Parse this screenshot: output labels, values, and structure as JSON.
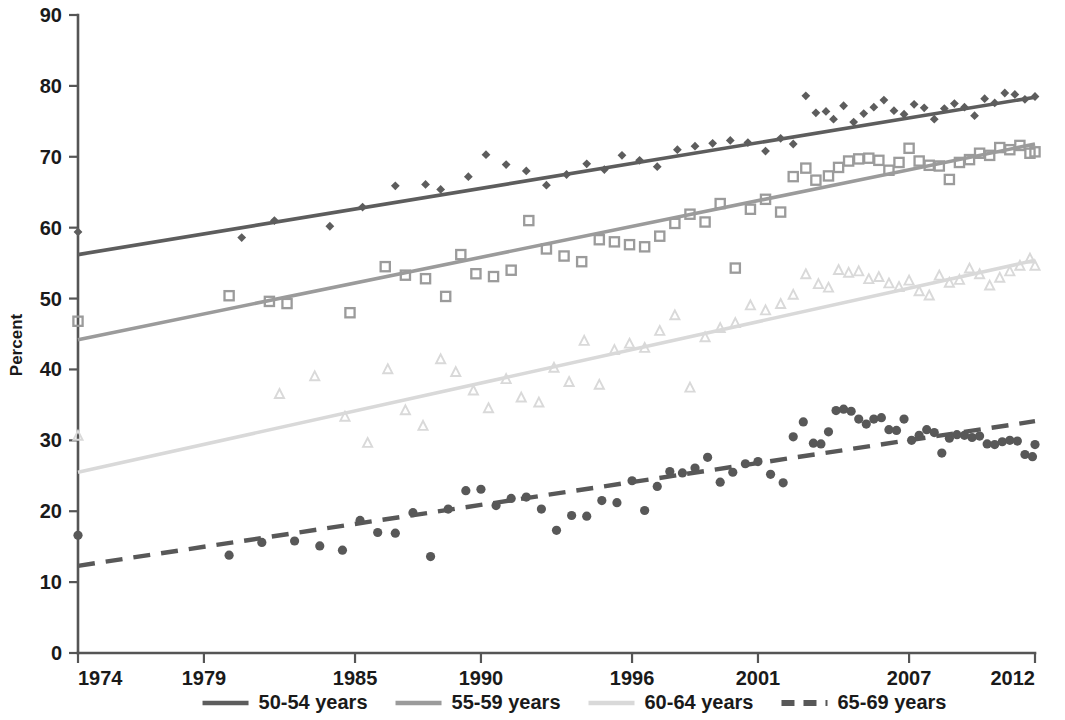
{
  "chart_data": {
    "type": "scatter",
    "title": "",
    "subtitle": "",
    "xlabel": "",
    "ylabel": "Percent",
    "xlim": [
      1974,
      2012
    ],
    "ylim": [
      0,
      90
    ],
    "grid": false,
    "legend_position": "bottom",
    "y_ticks": [
      0,
      10,
      20,
      30,
      40,
      50,
      60,
      70,
      80,
      90
    ],
    "x_ticks": [
      1974,
      1979,
      1985,
      1990,
      1996,
      2001,
      2007,
      2012
    ],
    "y_tick_labels": [
      "0",
      "10",
      "20",
      "30",
      "40",
      "50",
      "60",
      "70",
      "80",
      "90"
    ],
    "x_tick_labels": [
      "1974",
      "1979",
      "1985",
      "1990",
      "1996",
      "2001",
      "2007",
      "2012"
    ],
    "series": [
      {
        "name": "50-54 years",
        "color": "#5d5d5d",
        "marker": "diamond",
        "linestyle": "solid",
        "trend_start": [
          1974,
          56.2
        ],
        "trend_end": [
          2012,
          78.4
        ],
        "x": [
          1974,
          1980.5,
          1981.8,
          1984.0,
          1985.3,
          1986.6,
          1987.8,
          1988.4,
          1989.5,
          1990.2,
          1991.0,
          1991.8,
          1992.6,
          1993.4,
          1994.2,
          1994.9,
          1995.6,
          1996.3,
          1997.0,
          1997.8,
          1998.5,
          1999.2,
          1999.9,
          2000.6,
          2001.3,
          2001.9,
          2002.4,
          2002.9,
          2003.3,
          2003.7,
          2004.0,
          2004.4,
          2004.8,
          2005.2,
          2005.6,
          2006.0,
          2006.4,
          2006.8,
          2007.2,
          2007.6,
          2008.0,
          2008.4,
          2008.8,
          2009.2,
          2009.6,
          2010.0,
          2010.4,
          2010.8,
          2011.2,
          2011.6,
          2012.0
        ],
        "y": [
          59.4,
          58.6,
          61.0,
          60.2,
          62.9,
          65.9,
          66.1,
          65.4,
          67.2,
          70.3,
          68.9,
          68.0,
          66.0,
          67.5,
          69.0,
          68.2,
          70.2,
          69.5,
          68.6,
          71.0,
          71.5,
          71.9,
          72.3,
          72.0,
          70.8,
          72.6,
          71.8,
          78.6,
          76.2,
          76.4,
          75.3,
          77.2,
          74.9,
          76.1,
          77.0,
          78.0,
          76.5,
          76.0,
          77.4,
          76.9,
          75.3,
          76.8,
          77.5,
          77.0,
          75.8,
          78.2,
          77.6,
          79.0,
          78.8,
          78.1,
          78.5
        ]
      },
      {
        "name": "55-59 years",
        "color": "#9b9b9b",
        "marker": "square",
        "linestyle": "solid",
        "trend_start": [
          1974,
          44.2
        ],
        "trend_end": [
          2012,
          71.8
        ],
        "x": [
          1974,
          1980.0,
          1981.6,
          1982.3,
          1984.8,
          1986.2,
          1987.0,
          1987.8,
          1988.6,
          1989.2,
          1989.8,
          1990.5,
          1991.2,
          1991.9,
          1992.6,
          1993.3,
          1994.0,
          1994.7,
          1995.3,
          1995.9,
          1996.5,
          1997.1,
          1997.7,
          1998.3,
          1998.9,
          1999.5,
          2000.1,
          2000.7,
          2001.3,
          2001.9,
          2002.4,
          2002.9,
          2003.3,
          2003.8,
          2004.2,
          2004.6,
          2005.0,
          2005.4,
          2005.8,
          2006.2,
          2006.6,
          2007.0,
          2007.4,
          2007.8,
          2008.2,
          2008.6,
          2009.0,
          2009.4,
          2009.8,
          2010.2,
          2010.6,
          2011.0,
          2011.4,
          2011.8,
          2012.0
        ],
        "y": [
          46.8,
          50.4,
          49.6,
          49.3,
          48.0,
          54.5,
          53.3,
          52.8,
          50.3,
          56.2,
          53.5,
          53.1,
          54.0,
          61.0,
          57.0,
          56.0,
          55.2,
          58.3,
          58.0,
          57.6,
          57.3,
          58.8,
          60.6,
          61.9,
          60.8,
          63.4,
          54.3,
          62.6,
          64.0,
          62.2,
          67.2,
          68.4,
          66.7,
          67.3,
          68.5,
          69.4,
          69.7,
          69.8,
          69.5,
          68.1,
          69.2,
          71.2,
          69.4,
          68.8,
          68.7,
          66.8,
          69.2,
          69.6,
          70.5,
          70.2,
          71.3,
          71.0,
          71.6,
          70.5,
          70.7
        ]
      },
      {
        "name": "60-64 years",
        "color": "#d9d9d9",
        "marker": "triangle",
        "linestyle": "solid",
        "trend_start": [
          1974,
          25.5
        ],
        "trend_end": [
          2012,
          55.4
        ],
        "x": [
          1974,
          1982.0,
          1983.4,
          1984.6,
          1985.5,
          1986.3,
          1987.0,
          1987.7,
          1988.4,
          1989.0,
          1989.7,
          1990.3,
          1991.0,
          1991.6,
          1992.3,
          1992.9,
          1993.5,
          1994.1,
          1994.7,
          1995.3,
          1995.9,
          1996.5,
          1997.1,
          1997.7,
          1998.3,
          1998.9,
          1999.5,
          2000.1,
          2000.7,
          2001.3,
          2001.9,
          2002.4,
          2002.9,
          2003.4,
          2003.8,
          2004.2,
          2004.6,
          2005.0,
          2005.4,
          2005.8,
          2006.2,
          2006.6,
          2007.0,
          2007.4,
          2007.8,
          2008.2,
          2008.6,
          2009.0,
          2009.4,
          2009.8,
          2010.2,
          2010.6,
          2011.0,
          2011.4,
          2011.8,
          2012.0
        ],
        "y": [
          30.6,
          36.5,
          39.0,
          33.3,
          29.6,
          40.0,
          34.2,
          32.0,
          41.4,
          39.6,
          37.0,
          34.5,
          38.6,
          36.0,
          35.3,
          40.2,
          38.2,
          44.0,
          37.8,
          42.7,
          43.6,
          43.0,
          45.4,
          47.6,
          37.4,
          44.5,
          45.8,
          46.5,
          49.0,
          48.3,
          49.2,
          50.5,
          53.4,
          52.0,
          51.5,
          54.0,
          53.6,
          53.8,
          52.7,
          53.0,
          52.1,
          51.6,
          52.5,
          51.0,
          50.4,
          53.2,
          52.2,
          52.6,
          54.2,
          53.4,
          51.8,
          52.9,
          53.8,
          54.6,
          55.6,
          54.6
        ]
      },
      {
        "name": "65-69 years",
        "color": "#585858",
        "marker": "circle",
        "linestyle": "dashed",
        "trend_start": [
          1974,
          12.3
        ],
        "trend_end": [
          2012,
          32.7
        ],
        "x": [
          1974,
          1980.0,
          1981.3,
          1982.6,
          1983.6,
          1984.5,
          1985.2,
          1985.9,
          1986.6,
          1987.3,
          1988.0,
          1988.7,
          1989.4,
          1990.0,
          1990.6,
          1991.2,
          1991.8,
          1992.4,
          1993.0,
          1993.6,
          1994.2,
          1994.8,
          1995.4,
          1996.0,
          1996.5,
          1997.0,
          1997.5,
          1998.0,
          1998.5,
          1999.0,
          1999.5,
          2000.0,
          2000.5,
          2001.0,
          2001.5,
          2002.0,
          2002.4,
          2002.8,
          2003.2,
          2003.5,
          2003.8,
          2004.1,
          2004.4,
          2004.7,
          2005.0,
          2005.3,
          2005.6,
          2005.9,
          2006.2,
          2006.5,
          2006.8,
          2007.1,
          2007.4,
          2007.7,
          2008.0,
          2008.3,
          2008.6,
          2008.9,
          2009.2,
          2009.5,
          2009.8,
          2010.1,
          2010.4,
          2010.7,
          2011.0,
          2011.3,
          2011.6,
          2011.9,
          2012.0
        ],
        "y": [
          16.6,
          13.8,
          15.6,
          15.8,
          15.1,
          14.5,
          18.7,
          17.0,
          16.9,
          19.8,
          13.6,
          20.3,
          22.9,
          23.1,
          20.8,
          21.8,
          22.0,
          20.3,
          17.3,
          19.4,
          19.3,
          21.5,
          21.2,
          24.3,
          20.1,
          23.5,
          25.6,
          25.4,
          26.1,
          27.6,
          24.1,
          25.5,
          26.7,
          27.0,
          25.2,
          24.0,
          30.5,
          32.6,
          29.6,
          29.5,
          31.2,
          34.2,
          34.4,
          34.1,
          33.0,
          32.3,
          33.0,
          33.2,
          31.5,
          31.4,
          33.0,
          30.0,
          30.7,
          31.5,
          31.1,
          28.2,
          30.3,
          30.8,
          30.7,
          30.4,
          30.6,
          29.5,
          29.4,
          29.8,
          30.0,
          29.9,
          28.0,
          27.7,
          29.4
        ]
      }
    ],
    "legend": [
      {
        "label": "50-54 years",
        "color": "#5d5d5d",
        "style": "solid"
      },
      {
        "label": "55-59 years",
        "color": "#9b9b9b",
        "style": "solid"
      },
      {
        "label": "60-64 years",
        "color": "#d9d9d9",
        "style": "solid"
      },
      {
        "label": "65-69 years",
        "color": "#585858",
        "style": "dashed"
      }
    ]
  }
}
